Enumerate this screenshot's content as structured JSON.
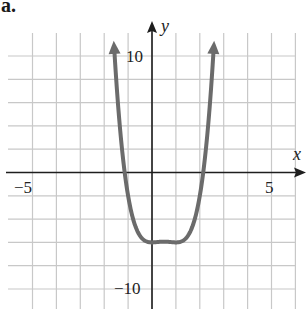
{
  "panel_label": "a.",
  "colors": {
    "grid": "#c8c8c8",
    "axis": "#1e1e1e",
    "curve": "#6b6b6b",
    "background": "#ffffff"
  },
  "chart_data": {
    "type": "line",
    "title": "",
    "panel": "a.",
    "function": "y = x^2 (x - 1)^2 - 6",
    "xlabel": "x",
    "ylabel": "y",
    "xlim": [
      -6,
      6
    ],
    "ylim": [
      -12,
      12
    ],
    "x_ticks_labeled": [
      -5,
      5
    ],
    "y_ticks_labeled": [
      10,
      -10
    ],
    "x_tick_labels": [
      "−5",
      "5"
    ],
    "y_tick_labels": [
      "10",
      "−10"
    ],
    "grid": true,
    "grid_x_step": 1,
    "grid_y_step": 2,
    "arrows_on_curve": true,
    "key_points": [
      {
        "x": -1.6,
        "y": 12
      },
      {
        "x": -1.14,
        "y": 0
      },
      {
        "x": 0,
        "y": -6
      },
      {
        "x": 0.5,
        "y": -5.94
      },
      {
        "x": 1,
        "y": -6
      },
      {
        "x": 2.14,
        "y": 0
      },
      {
        "x": 2.6,
        "y": 12
      }
    ],
    "x_intercepts": [
      -1.14,
      2.14
    ],
    "y_intercept": -6,
    "minimum_value": -6
  }
}
